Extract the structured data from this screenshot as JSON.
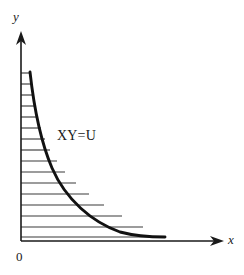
{
  "figure": {
    "background_color": "#ffffff",
    "width": 244,
    "height": 275
  },
  "axes": {
    "y_axis": {
      "label": "y",
      "color": "#1a1a1a",
      "x": 21,
      "y_top": 33,
      "y_bottom": 241,
      "arrow": "up"
    },
    "x_axis": {
      "label": "x",
      "color": "#1a1a1a",
      "y": 241,
      "x_left": 21,
      "x_right": 222,
      "arrow": "right"
    },
    "origin": {
      "label": "0",
      "x": 21,
      "y": 241
    }
  },
  "curve": {
    "label": "XY=U",
    "equation": "XY=U",
    "color": "#111111",
    "stroke_width": 2.9,
    "label_x": 57,
    "label_y": 128,
    "path": "M 30 72 C 34 108, 40 140, 52 168 C 66 200, 92 222, 120 232 C 135 236, 152 237, 165 237"
  },
  "hatching": {
    "color": "#3a3a3a",
    "stroke_width": 1.15,
    "count": 15,
    "lines": [
      {
        "y": 73,
        "x_start": 21,
        "x_end": 30
      },
      {
        "y": 84,
        "x_start": 21,
        "x_end": 31
      },
      {
        "y": 95,
        "x_start": 21,
        "x_end": 33
      },
      {
        "y": 106,
        "x_start": 21,
        "x_end": 35
      },
      {
        "y": 117,
        "x_start": 21,
        "x_end": 38
      },
      {
        "y": 128,
        "x_start": 21,
        "x_end": 41
      },
      {
        "y": 139,
        "x_start": 21,
        "x_end": 45
      },
      {
        "y": 150,
        "x_start": 21,
        "x_end": 50
      },
      {
        "y": 161,
        "x_start": 21,
        "x_end": 57
      },
      {
        "y": 172,
        "x_start": 21,
        "x_end": 65
      },
      {
        "y": 183,
        "x_start": 21,
        "x_end": 76
      },
      {
        "y": 194,
        "x_start": 21,
        "x_end": 89
      },
      {
        "y": 205,
        "x_start": 21,
        "x_end": 104
      },
      {
        "y": 216,
        "x_start": 21,
        "x_end": 122
      },
      {
        "y": 227,
        "x_start": 21,
        "x_end": 143
      },
      {
        "y": 237,
        "x_start": 21,
        "x_end": 165
      }
    ]
  },
  "chart_data": {
    "type": "line",
    "title": "",
    "xlabel": "x",
    "ylabel": "y",
    "annotations": [
      {
        "text": "XY=U",
        "x": 57,
        "y": 128
      },
      {
        "text": "0",
        "x": 16,
        "y": 249
      }
    ],
    "grid": false,
    "legend": null,
    "series": [
      {
        "name": "XY=U",
        "description": "Rectangular hyperbola; shaded (hatched) region bounded by the curve, the y-axis and the x-axis",
        "x": [
          30,
          31,
          33,
          35,
          38,
          41,
          45,
          50,
          57,
          65,
          76,
          89,
          104,
          122,
          143,
          165
        ],
        "y": [
          73,
          84,
          95,
          106,
          117,
          128,
          139,
          150,
          161,
          172,
          183,
          194,
          205,
          216,
          227,
          237
        ]
      }
    ]
  }
}
